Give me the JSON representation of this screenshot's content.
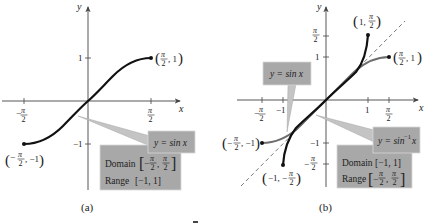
{
  "figure": {
    "panels": [
      {
        "id": "a",
        "caption": "(a)",
        "axes": {
          "x_label": "x",
          "y_label": "y"
        },
        "x_ticks": [
          {
            "num": "π",
            "den": "2",
            "sign": "−"
          },
          {
            "num": "π",
            "den": "2",
            "sign": ""
          }
        ],
        "y_ticks": [
          "1",
          "−1"
        ],
        "curve": {
          "name": "y = sin x",
          "domain": "[−π/2, π/2]",
          "range": "[−1, 1]"
        },
        "points": [
          {
            "label_left": "(",
            "sign": "",
            "num": "π",
            "den": "2",
            "rest": ", 1)"
          },
          {
            "label_left": "(",
            "sign": "−",
            "num": "π",
            "den": "2",
            "rest": ", −1)"
          }
        ],
        "callout": {
          "equation": "y = sin x"
        },
        "info_box": {
          "domain_label": "Domain",
          "domain_lo_sign": "−",
          "domain_num": "π",
          "domain_den": "2",
          "range_label": "Range",
          "range_value": "[−1, 1]"
        }
      },
      {
        "id": "b",
        "caption": "(b)",
        "axes": {
          "x_label": "x",
          "y_label": "y"
        },
        "x_ticks": [
          "−1",
          "1"
        ],
        "x_ticks_frac": {
          "num": "π",
          "den": "2"
        },
        "y_ticks": [
          "1",
          "−1"
        ],
        "y_ticks_frac": {
          "num": "π",
          "den": "2"
        },
        "curves": [
          {
            "name": "y = sin x",
            "color": "#707070"
          },
          {
            "name": "y = sin⁻¹ x",
            "color": "#111111"
          },
          {
            "name": "y = x",
            "style": "dashed"
          }
        ],
        "points": {
          "p1": {
            "text": "1, ",
            "num": "π",
            "den": "2"
          },
          "p2": {
            "num": "π",
            "den": "2",
            "text": ", 1"
          },
          "p3": {
            "num": "π",
            "den": "2",
            "text": ", −1"
          },
          "p4": {
            "text": "−1, −",
            "num": "π",
            "den": "2"
          }
        },
        "callout_sin": {
          "equation": "y = sin x"
        },
        "callout_arcsin": {
          "equation_prefix": "y = sin",
          "superscript": "−1",
          "equation_suffix": "x"
        },
        "info_box": {
          "domain_label": "Domain",
          "domain_value": "[−1, 1]",
          "range_label": "Range",
          "range_num": "π",
          "range_den": "2"
        }
      }
    ]
  },
  "colors": {
    "callout_fill": "#a8a8a8",
    "callout_pointer": "#c4c4c4",
    "axis": "#444444",
    "curve_dark": "#111111",
    "curve_gray": "#6e6e6e"
  }
}
